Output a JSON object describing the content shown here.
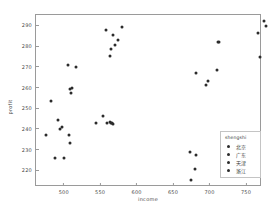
{
  "chart_data": {
    "type": "scatter",
    "title": "",
    "xlabel": "income",
    "ylabel": "profit",
    "xlim": [
      462,
      772
    ],
    "ylim": [
      212,
      295
    ],
    "xticks": [
      500,
      550,
      600,
      650,
      700,
      750
    ],
    "yticks": [
      220,
      230,
      240,
      250,
      260,
      270,
      280,
      290
    ],
    "grid": false,
    "legend": {
      "title": "shengshi",
      "position": "lower right",
      "entries": [
        "北京",
        "广东",
        "天津",
        "浙江"
      ]
    },
    "marker_color": "#2b2b2b",
    "series": [
      {
        "name": "北京",
        "values": [
          [
            476,
            237.2
          ],
          [
            483,
            253.3
          ],
          [
            488,
            226.0
          ],
          [
            492,
            244.5
          ],
          [
            495,
            240.2
          ],
          [
            497,
            240.8
          ],
          [
            501,
            226.0
          ],
          [
            506,
            271.0
          ],
          [
            507,
            237.0
          ],
          [
            508,
            233.0
          ],
          [
            509,
            259.2
          ],
          [
            510,
            257.5
          ],
          [
            512,
            259.8
          ],
          [
            517,
            269.8
          ]
        ]
      },
      {
        "name": "广东",
        "values": [
          [
            544,
            243.0
          ],
          [
            554,
            246.2
          ],
          [
            560,
            243.0
          ],
          [
            563,
            243.2
          ],
          [
            565,
            243.0
          ],
          [
            566,
            242.8
          ],
          [
            567,
            242.6
          ],
          [
            563,
            275.3
          ],
          [
            565,
            278.5
          ],
          [
            568,
            285.2
          ],
          [
            571,
            280.7
          ],
          [
            574,
            283.0
          ],
          [
            558,
            288.0
          ],
          [
            580,
            289.0
          ]
        ]
      },
      {
        "name": "天津",
        "values": [
          [
            673,
            229.0
          ],
          [
            674,
            215.5
          ],
          [
            680,
            220.6
          ],
          [
            682,
            227.5
          ]
        ]
      },
      {
        "name": "浙江",
        "values": [
          [
            681,
            267.2
          ],
          [
            695,
            261.0
          ],
          [
            698,
            263.0
          ],
          [
            710,
            268.5
          ],
          [
            711,
            281.8
          ],
          [
            713,
            282.0
          ],
          [
            766,
            286.3
          ],
          [
            769,
            274.5
          ],
          [
            775,
            292.0
          ],
          [
            777,
            289.8
          ]
        ]
      }
    ]
  }
}
